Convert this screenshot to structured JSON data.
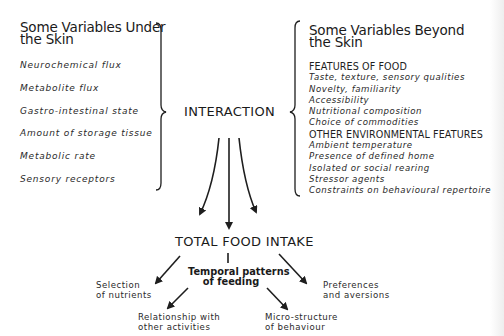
{
  "left_group": {
    "heading_line1": "Some Variables Under",
    "heading_line2": "the Skin",
    "items": [
      "Neurochemical flux",
      "Metabolite flux",
      "Gastro-intestinal state",
      "Amount of storage tissue",
      "Metabolic rate",
      "Sensory receptors"
    ]
  },
  "right_group": {
    "heading_line1": "Some Variables Beyond",
    "heading_line2": "the Skin",
    "categories": [
      {
        "title": "FEATURES OF FOOD",
        "items": [
          "Taste, texture, sensory qualities",
          "Novelty, familiarity",
          "Accessibility",
          "Nutritional composition",
          "Choice of commodities"
        ]
      },
      {
        "title": "OTHER ENVIRONMENTAL FEATURES",
        "items": [
          "Ambient temperature",
          "Presence of defined home",
          "Isolated or social rearing",
          "Stressor agents",
          "Constraints on behavioural repertoire"
        ]
      }
    ]
  },
  "center": {
    "interaction": "INTERACTION",
    "total_food_intake": "TOTAL FOOD INTAKE",
    "temporal_line1": "Temporal patterns",
    "temporal_line2": "of feeding"
  },
  "outcomes": {
    "selection": [
      "Selection",
      "of nutrients"
    ],
    "preferences": [
      "Preferences",
      "and aversions"
    ],
    "relationship": [
      "Relationship with",
      "other activities"
    ],
    "microstructure": [
      "Micro-structure",
      "of behaviour"
    ]
  },
  "colors": {
    "ink": "#1e1e1e",
    "background": "#ffffff"
  }
}
